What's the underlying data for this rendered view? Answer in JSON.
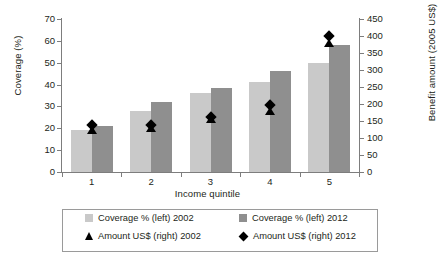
{
  "chart_data": {
    "type": "bar",
    "title": "",
    "xlabel": "Income quintile",
    "ylabel": "Coverage (%)",
    "y2label": "Benefit amount (2005 US$)",
    "categories": [
      "1",
      "2",
      "3",
      "4",
      "5"
    ],
    "ylim": [
      0,
      70
    ],
    "yticks": [
      0,
      10,
      20,
      30,
      40,
      50,
      60,
      70
    ],
    "y2lim": [
      0,
      450
    ],
    "y2ticks": [
      0,
      50,
      100,
      150,
      200,
      250,
      300,
      350,
      400,
      450
    ],
    "grid": false,
    "legend_position": "bottom",
    "series": [
      {
        "name": "Coverage % (left) 2002",
        "kind": "bar",
        "axis": "left",
        "color": "#c9c9c9",
        "values": [
          19,
          28,
          36,
          41,
          50
        ]
      },
      {
        "name": "Coverage % (left) 2012",
        "kind": "bar",
        "axis": "left",
        "color": "#8f8f8f",
        "values": [
          21,
          32,
          38.5,
          46,
          58
        ]
      },
      {
        "name": "Amount US$ (right) 2002",
        "kind": "marker",
        "marker": "triangle",
        "axis": "right",
        "color": "#000000",
        "values": [
          125,
          130,
          155,
          180,
          378
        ]
      },
      {
        "name": "Amount US$ (right) 2012",
        "kind": "marker",
        "marker": "diamond",
        "axis": "right",
        "color": "#000000",
        "values": [
          138,
          137,
          162,
          196,
          400
        ]
      }
    ]
  },
  "legend": {
    "entries": [
      {
        "label": "Coverage % (left) 2002",
        "glyph": "square-light-icon"
      },
      {
        "label": "Coverage % (left) 2012",
        "glyph": "square-dark-icon"
      },
      {
        "label": "Amount US$ (right) 2002",
        "glyph": "triangle-marker-icon"
      },
      {
        "label": "Amount US$ (right) 2012",
        "glyph": "diamond-marker-icon"
      }
    ]
  },
  "axes": {
    "left_label": "Coverage (%)",
    "right_label": "Benefit amount (2005 US$)",
    "x_label": "Income quintile",
    "left_ticks": [
      "0",
      "10",
      "20",
      "30",
      "40",
      "50",
      "60",
      "70"
    ],
    "right_ticks": [
      "0",
      "50",
      "100",
      "150",
      "200",
      "250",
      "300",
      "350",
      "400",
      "450"
    ],
    "x_ticks": [
      "1",
      "2",
      "3",
      "4",
      "5"
    ]
  }
}
